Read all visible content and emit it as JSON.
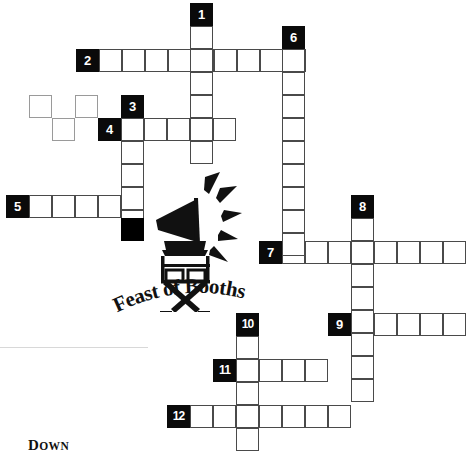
{
  "puzzle": {
    "type": "crossword-grid",
    "title_logo": {
      "text": "Feast of Booths",
      "icon_names": [
        "megaphone-icon",
        "directors-chair-icon"
      ]
    },
    "footer": {
      "down_label": "Down"
    },
    "cell_size": 23,
    "colors": {
      "clue_box": "#0a0a0a",
      "block": "#000000",
      "cell_border": "#4a4a4a",
      "faint_border": "#9a9a9a",
      "paper": "#ffffff"
    },
    "clue_numbers": [
      "1",
      "2",
      "3",
      "4",
      "5",
      "6",
      "7",
      "8",
      "9",
      "10",
      "11",
      "12"
    ],
    "clue_boxes": [
      {
        "n": "1",
        "x": 190,
        "y": 3
      },
      {
        "n": "2",
        "x": 76,
        "y": 49
      },
      {
        "n": "3",
        "x": 121,
        "y": 95
      },
      {
        "n": "4",
        "x": 98,
        "y": 118
      },
      {
        "n": "5",
        "x": 6,
        "y": 195
      },
      {
        "n": "6",
        "x": 282,
        "y": 26
      },
      {
        "n": "7",
        "x": 259,
        "y": 241
      },
      {
        "n": "8",
        "x": 351,
        "y": 195
      },
      {
        "n": "9",
        "x": 328,
        "y": 313
      },
      {
        "n": "10",
        "x": 236,
        "y": 313
      },
      {
        "n": "11",
        "x": 213,
        "y": 359
      },
      {
        "n": "12",
        "x": 167,
        "y": 405
      }
    ],
    "entries": [
      {
        "name": "across-2",
        "number": "2",
        "direction": "across",
        "length": 9,
        "start": {
          "x": 99,
          "y": 49
        }
      },
      {
        "name": "across-4",
        "number": "4",
        "direction": "across",
        "length": 5,
        "start": {
          "x": 121,
          "y": 118
        }
      },
      {
        "name": "across-5",
        "number": "5",
        "direction": "across",
        "length": 5,
        "start": {
          "x": 29,
          "y": 195
        }
      },
      {
        "name": "across-7",
        "number": "7",
        "direction": "across",
        "length": 8,
        "start": {
          "x": 282,
          "y": 241
        }
      },
      {
        "name": "across-9",
        "number": "9",
        "direction": "across",
        "length": 5,
        "start": {
          "x": 351,
          "y": 313
        }
      },
      {
        "name": "across-11",
        "number": "11",
        "direction": "across",
        "length": 4,
        "start": {
          "x": 236,
          "y": 359
        }
      },
      {
        "name": "across-12",
        "number": "12",
        "direction": "across",
        "length": 7,
        "start": {
          "x": 190,
          "y": 405
        }
      },
      {
        "name": "down-1",
        "number": "1",
        "direction": "down",
        "length": 6,
        "start": {
          "x": 190,
          "y": 26
        }
      },
      {
        "name": "down-3",
        "number": "3",
        "direction": "down",
        "length": 5,
        "start": {
          "x": 121,
          "y": 118
        }
      },
      {
        "name": "down-6",
        "number": "6",
        "direction": "down",
        "length": 9,
        "start": {
          "x": 282,
          "y": 49
        }
      },
      {
        "name": "down-8",
        "number": "8",
        "direction": "down",
        "length": 8,
        "start": {
          "x": 351,
          "y": 218
        }
      },
      {
        "name": "down-10",
        "number": "10",
        "direction": "down",
        "length": 5,
        "start": {
          "x": 236,
          "y": 336
        }
      }
    ],
    "faint_cells": [
      {
        "x": 29,
        "y": 95
      },
      {
        "x": 75,
        "y": 95
      },
      {
        "x": 52,
        "y": 118
      }
    ],
    "block_cells": [
      {
        "x": 121,
        "y": 218
      }
    ]
  }
}
